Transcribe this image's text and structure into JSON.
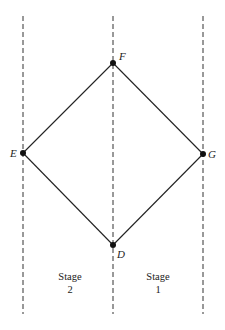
{
  "diagram": {
    "type": "lattice-diamond",
    "nodes": [
      {
        "id": "F",
        "label": "F",
        "x": 113,
        "y": 63
      },
      {
        "id": "E",
        "label": "E",
        "x": 23,
        "y": 153
      },
      {
        "id": "G",
        "label": "G",
        "x": 203,
        "y": 154
      },
      {
        "id": "D",
        "label": "D",
        "x": 113,
        "y": 245
      }
    ],
    "edges": [
      [
        "F",
        "E"
      ],
      [
        "F",
        "G"
      ],
      [
        "E",
        "D"
      ],
      [
        "G",
        "D"
      ]
    ],
    "stage_columns": [
      {
        "label_line1": "Stage",
        "label_line2": "2"
      },
      {
        "label_line1": "Stage",
        "label_line2": "1"
      }
    ]
  }
}
